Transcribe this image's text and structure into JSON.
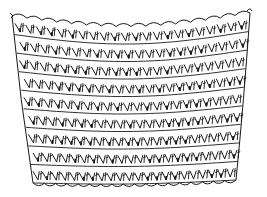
{
  "image": {
    "subject": "crochet stitch swatch illustration",
    "style": "black ink line drawing on white",
    "background_color": "#ffffff",
    "ink_color": "#1a1a1a"
  },
  "swatch": {
    "top_edge": {
      "left": [
        12,
        16
      ],
      "right": [
        250,
        13
      ],
      "sag": 12
    },
    "bottom_edge": {
      "left": [
        33,
        80
      ],
      "right": [
        236,
        78
      ],
      "bow": 4
    },
    "rows": 9,
    "stitches_per_row": 22,
    "top_border": {
      "type": "picot scallops",
      "count": 16
    },
    "bottom_border": {
      "type": "small scallops",
      "count": 18
    }
  }
}
